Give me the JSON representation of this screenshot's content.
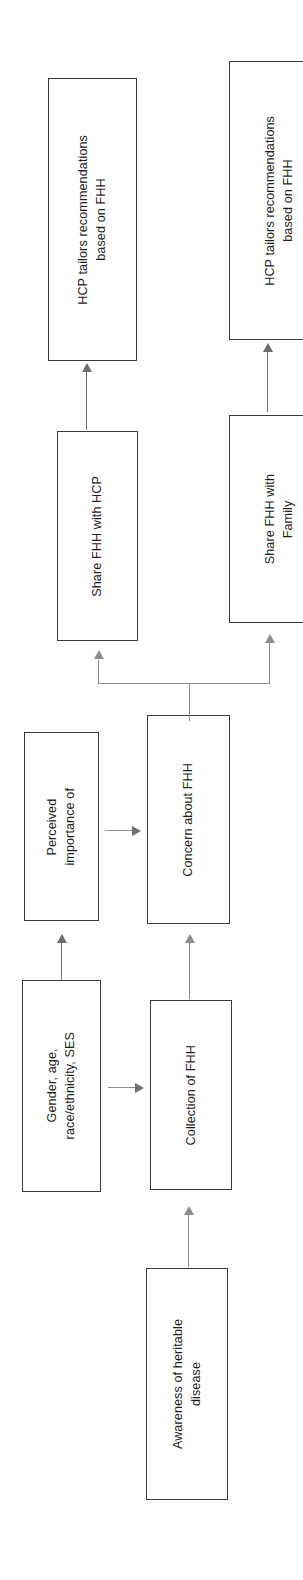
{
  "diagram": {
    "orientation": "rotated-90-ccw",
    "background_color": "#ffffff",
    "box_border_color": "#3a3a3a",
    "connector_color": "#6e6e6e",
    "connector_color_light": "#8c8c8c",
    "text_color": "#1d1d1d",
    "nodes": [
      {
        "id": "hcp-tailors-top",
        "label": "HCP tailors recommendations\nbased on FHH"
      },
      {
        "id": "hcp-tailors-bottom",
        "label": "HCP tailors recommendations\nbased on FHH"
      },
      {
        "id": "share-hcp",
        "label": "Share FHH with HCP"
      },
      {
        "id": "share-family",
        "label": "Share FHH with\nFamily"
      },
      {
        "id": "perceived-importance",
        "label": "Perceived\nimportance of"
      },
      {
        "id": "concern-fhh",
        "label": "Concern about FHH"
      },
      {
        "id": "demographics",
        "label": "Gender, age,\nrace/ethnicity, SES"
      },
      {
        "id": "collection-fhh",
        "label": "Collection of FHH"
      },
      {
        "id": "awareness",
        "label": "Awareness of heritable\ndisease"
      }
    ],
    "edges": [
      {
        "id": "edge-share-hcp-to-tailors",
        "from": "share-hcp",
        "to": "hcp-tailors-top"
      },
      {
        "id": "edge-share-family-to-tailors",
        "from": "share-family",
        "to": "hcp-tailors-bottom"
      },
      {
        "id": "edge-concern-to-share-hcp",
        "from": "concern-fhh",
        "to": "share-hcp"
      },
      {
        "id": "edge-concern-to-share-family",
        "from": "concern-fhh",
        "to": "share-family"
      },
      {
        "id": "edge-demographics-to-perceived",
        "from": "demographics",
        "to": "perceived-importance"
      },
      {
        "id": "edge-demographics-to-collection",
        "from": "demographics",
        "to": "collection-fhh"
      },
      {
        "id": "edge-perceived-to-concern",
        "from": "perceived-importance",
        "to": "concern-fhh"
      },
      {
        "id": "edge-collection-to-concern",
        "from": "collection-fhh",
        "to": "concern-fhh"
      },
      {
        "id": "edge-awareness-to-collection",
        "from": "awareness",
        "to": "collection-fhh"
      }
    ]
  }
}
